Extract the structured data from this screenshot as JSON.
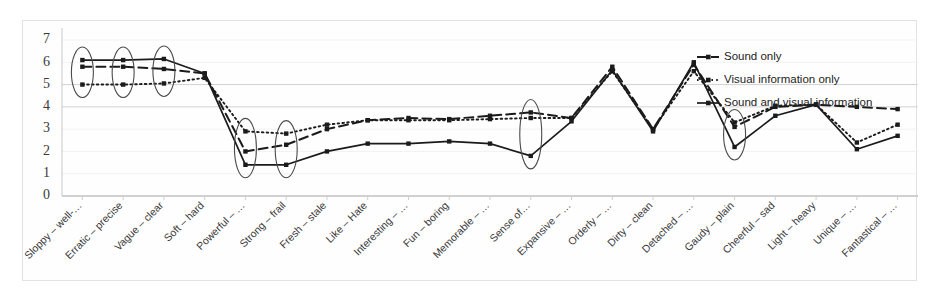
{
  "chart_data": {
    "type": "line",
    "title": "",
    "subtitle": "",
    "xlabel": "",
    "ylabel": "",
    "ylim": [
      0,
      7
    ],
    "yticks": [
      0,
      1,
      2,
      3,
      4,
      5,
      6,
      7
    ],
    "grid": true,
    "legend_position": "top-right",
    "categories": [
      "Sloppy – well-…",
      "Erratic – precise",
      "Vague – clear",
      "Soft – hard",
      "Powerful – …",
      "Strong – frail",
      "Fresh – stale",
      "Like – Hate",
      "Interesting – …",
      "Fun – boring",
      "Memorable – …",
      "Sense of…",
      "Expansive – …",
      "Orderly – …",
      "Dirty – clean",
      "Detached – …",
      "Gaudy – plain",
      "Cheerful – sad",
      "Light – heavy",
      "Unique – …",
      "Fantastical – …"
    ],
    "series": [
      {
        "name": "Sound only",
        "style": "dashed",
        "values": [
          5.8,
          5.8,
          5.7,
          5.5,
          2.0,
          2.3,
          3.0,
          3.4,
          3.5,
          3.45,
          3.6,
          3.75,
          3.5,
          5.8,
          3.0,
          5.9,
          3.1,
          4.0,
          4.1,
          4.0,
          3.9
        ]
      },
      {
        "name": "Visual information only",
        "style": "dotted",
        "values": [
          5.0,
          5.0,
          5.05,
          5.3,
          2.9,
          2.8,
          3.2,
          3.4,
          3.4,
          3.4,
          3.45,
          3.5,
          3.5,
          5.6,
          3.0,
          5.6,
          3.3,
          4.05,
          4.1,
          2.4,
          3.2
        ]
      },
      {
        "name": "Sound and visual information",
        "style": "solid",
        "values": [
          6.1,
          6.1,
          6.15,
          5.5,
          1.4,
          1.4,
          2.0,
          2.35,
          2.35,
          2.45,
          2.35,
          1.8,
          3.35,
          5.65,
          2.9,
          6.0,
          2.2,
          3.6,
          4.1,
          2.1,
          2.7
        ]
      }
    ],
    "annotations": [
      {
        "type": "ellipse",
        "category_index": 0,
        "label": "highlight-sloppy-well"
      },
      {
        "type": "ellipse",
        "category_index": 1,
        "label": "highlight-erratic-precise"
      },
      {
        "type": "ellipse",
        "category_index": 2,
        "label": "highlight-vague-clear"
      },
      {
        "type": "ellipse",
        "category_index": 4,
        "label": "highlight-powerful"
      },
      {
        "type": "ellipse",
        "category_index": 5,
        "label": "highlight-strong-frail"
      },
      {
        "type": "ellipse",
        "category_index": 11,
        "label": "highlight-sense-of"
      },
      {
        "type": "ellipse",
        "category_index": 16,
        "label": "highlight-gaudy-plain"
      }
    ]
  },
  "colors": {
    "ink": "#1b1b1b",
    "grid": "#dcdcdc",
    "axis": "#c9c9c9",
    "annotation": "#4a4a4a",
    "background": "#ffffff"
  }
}
